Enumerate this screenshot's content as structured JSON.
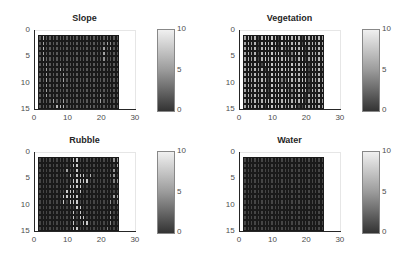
{
  "figure": {
    "panels": [
      {
        "title": "Slope",
        "left": 0,
        "top": 0
      },
      {
        "title": "Vegetation",
        "left": 205,
        "top": 0
      },
      {
        "title": "Rubble",
        "left": 0,
        "top": 122
      },
      {
        "title": "Water",
        "left": 205,
        "top": 122
      }
    ],
    "x_ticks": [
      "0",
      "10",
      "20",
      "30"
    ],
    "y_ticks": [
      "0",
      "5",
      "10",
      "15"
    ],
    "colorbar_ticks": [
      "10",
      "5",
      "0"
    ]
  },
  "chart_data": [
    {
      "type": "heatmap",
      "title": "Slope",
      "xlim": [
        0,
        30
      ],
      "ylim": [
        0,
        15
      ],
      "y_reversed": true,
      "x_ticks": [
        0,
        10,
        20,
        30
      ],
      "y_ticks": [
        0,
        5,
        10,
        15
      ],
      "extent_x": [
        1,
        25
      ],
      "extent_y": [
        1,
        15
      ],
      "clim": [
        0,
        10
      ],
      "colormap": "gray",
      "colorbar_ticks": [
        0,
        5,
        10
      ],
      "grid": [
        [
          2,
          7,
          2,
          2,
          2,
          2,
          2,
          2,
          2,
          2,
          2,
          2,
          2,
          2,
          2,
          2,
          2,
          2,
          2,
          2,
          3,
          2,
          2,
          2
        ],
        [
          2,
          6,
          2,
          2,
          2,
          2,
          2,
          2,
          2,
          2,
          2,
          2,
          2,
          2,
          2,
          2,
          2,
          2,
          2,
          3,
          6,
          5,
          2,
          2
        ],
        [
          2,
          7,
          2,
          2,
          2,
          2,
          2,
          2,
          2,
          2,
          2,
          2,
          2,
          2,
          2,
          2,
          2,
          2,
          2,
          6,
          3,
          6,
          2,
          2
        ],
        [
          2,
          6,
          2,
          2,
          2,
          2,
          2,
          2,
          2,
          2,
          2,
          2,
          2,
          2,
          2,
          2,
          2,
          2,
          2,
          6,
          2,
          2,
          2,
          2
        ],
        [
          2,
          6,
          3,
          2,
          2,
          2,
          2,
          2,
          2,
          2,
          2,
          2,
          2,
          2,
          2,
          2,
          2,
          2,
          2,
          5,
          2,
          2,
          2,
          2
        ],
        [
          2,
          3,
          5,
          2,
          2,
          2,
          3,
          2,
          2,
          2,
          2,
          2,
          2,
          2,
          2,
          2,
          2,
          2,
          2,
          3,
          2,
          2,
          2,
          2
        ],
        [
          1,
          2,
          6,
          2,
          2,
          2,
          6,
          3,
          2,
          2,
          2,
          2,
          2,
          2,
          2,
          2,
          2,
          2,
          2,
          2,
          2,
          2,
          2,
          2
        ],
        [
          2,
          2,
          6,
          2,
          2,
          2,
          2,
          6,
          2,
          2,
          2,
          2,
          2,
          2,
          2,
          2,
          2,
          2,
          2,
          2,
          2,
          2,
          2,
          2
        ],
        [
          2,
          2,
          6,
          2,
          2,
          2,
          2,
          6,
          2,
          2,
          2,
          2,
          2,
          2,
          2,
          2,
          2,
          2,
          2,
          2,
          2,
          2,
          2,
          2
        ],
        [
          2,
          2,
          5,
          2,
          2,
          2,
          2,
          5,
          2,
          2,
          2,
          2,
          2,
          2,
          2,
          2,
          2,
          2,
          2,
          2,
          2,
          2,
          2,
          2
        ],
        [
          2,
          2,
          6,
          2,
          2,
          2,
          2,
          2,
          2,
          2,
          2,
          2,
          2,
          2,
          2,
          2,
          2,
          2,
          2,
          2,
          2,
          2,
          2,
          2
        ],
        [
          2,
          2,
          6,
          2,
          2,
          2,
          2,
          2,
          2,
          2,
          2,
          2,
          2,
          2,
          2,
          2,
          2,
          2,
          5,
          2,
          2,
          2,
          2,
          2
        ],
        [
          2,
          2,
          2,
          2,
          6,
          2,
          2,
          6,
          2,
          2,
          2,
          2,
          2,
          2,
          2,
          2,
          2,
          2,
          6,
          2,
          2,
          2,
          2,
          2
        ],
        [
          2,
          2,
          2,
          2,
          2,
          7,
          7,
          7,
          2,
          2,
          2,
          2,
          2,
          2,
          2,
          3,
          2,
          2,
          2,
          2,
          2,
          2,
          2,
          2
        ]
      ]
    },
    {
      "type": "heatmap",
      "title": "Vegetation",
      "xlim": [
        0,
        30
      ],
      "ylim": [
        0,
        15
      ],
      "y_reversed": true,
      "x_ticks": [
        0,
        10,
        20,
        30
      ],
      "y_ticks": [
        0,
        5,
        10,
        15
      ],
      "extent_x": [
        1,
        25
      ],
      "extent_y": [
        1,
        15
      ],
      "clim": [
        0,
        10
      ],
      "colormap": "gray",
      "colorbar_ticks": [
        0,
        5,
        10
      ],
      "grid": [
        [
          6,
          7,
          6,
          7,
          1,
          7,
          8,
          7,
          8,
          7,
          1,
          8,
          7,
          8,
          7,
          8,
          7,
          1,
          7,
          6,
          7,
          6,
          7,
          6
        ],
        [
          6,
          7,
          6,
          7,
          1,
          7,
          8,
          7,
          8,
          7,
          1,
          8,
          7,
          8,
          7,
          8,
          7,
          1,
          7,
          6,
          7,
          6,
          7,
          6
        ],
        [
          6,
          7,
          6,
          7,
          1,
          7,
          8,
          7,
          8,
          7,
          1,
          7,
          4,
          4,
          7,
          8,
          7,
          8,
          1,
          6,
          7,
          6,
          7,
          6
        ],
        [
          6,
          7,
          6,
          7,
          1,
          7,
          8,
          7,
          8,
          7,
          8,
          7,
          4,
          4,
          4,
          8,
          7,
          8,
          1,
          6,
          7,
          6,
          7,
          6
        ],
        [
          6,
          7,
          6,
          7,
          1,
          7,
          8,
          7,
          8,
          7,
          8,
          7,
          8,
          7,
          4,
          4,
          7,
          8,
          1,
          6,
          7,
          6,
          7,
          6
        ],
        [
          6,
          7,
          6,
          7,
          6,
          1,
          8,
          7,
          8,
          7,
          8,
          7,
          8,
          7,
          8,
          7,
          7,
          8,
          7,
          1,
          7,
          6,
          7,
          6
        ],
        [
          6,
          7,
          6,
          7,
          6,
          7,
          1,
          7,
          8,
          7,
          8,
          7,
          8,
          7,
          8,
          7,
          7,
          8,
          7,
          1,
          7,
          6,
          7,
          3
        ],
        [
          6,
          7,
          6,
          7,
          6,
          7,
          7,
          1,
          8,
          7,
          8,
          7,
          8,
          7,
          8,
          7,
          7,
          8,
          7,
          1,
          7,
          6,
          7,
          3
        ],
        [
          6,
          7,
          6,
          7,
          6,
          7,
          7,
          1,
          8,
          7,
          8,
          4,
          4,
          8,
          7,
          7,
          7,
          8,
          7,
          1,
          7,
          6,
          7,
          6
        ],
        [
          6,
          7,
          6,
          7,
          6,
          7,
          7,
          1,
          8,
          7,
          8,
          4,
          8,
          4,
          7,
          7,
          7,
          8,
          7,
          1,
          7,
          6,
          7,
          6
        ],
        [
          6,
          7,
          6,
          7,
          6,
          7,
          7,
          1,
          8,
          7,
          8,
          7,
          8,
          4,
          4,
          7,
          7,
          8,
          7,
          1,
          7,
          6,
          7,
          6
        ],
        [
          6,
          7,
          6,
          7,
          6,
          7,
          7,
          1,
          8,
          7,
          8,
          7,
          8,
          7,
          4,
          7,
          7,
          8,
          1,
          6,
          7,
          6,
          7,
          6
        ],
        [
          6,
          7,
          6,
          7,
          6,
          7,
          7,
          8,
          8,
          7,
          8,
          7,
          8,
          7,
          7,
          7,
          7,
          8,
          1,
          6,
          7,
          6,
          7,
          6
        ],
        [
          6,
          7,
          6,
          7,
          6,
          7,
          1,
          8,
          8,
          7,
          8,
          7,
          5,
          7,
          7,
          7,
          1,
          1,
          6,
          6,
          7,
          6,
          7,
          6
        ]
      ]
    },
    {
      "type": "heatmap",
      "title": "Rubble",
      "xlim": [
        0,
        30
      ],
      "ylim": [
        0,
        15
      ],
      "y_reversed": true,
      "x_ticks": [
        0,
        10,
        20,
        30
      ],
      "y_ticks": [
        0,
        5,
        10,
        15
      ],
      "extent_x": [
        1,
        25
      ],
      "extent_y": [
        1,
        15
      ],
      "clim": [
        0,
        10
      ],
      "colormap": "gray",
      "colorbar_ticks": [
        0,
        5,
        10
      ],
      "grid": [
        [
          1,
          1,
          1,
          1,
          1,
          1,
          1,
          1,
          1,
          1,
          8,
          8,
          1,
          1,
          1,
          1,
          1,
          1,
          1,
          1,
          1,
          1,
          5,
          5
        ],
        [
          1,
          1,
          1,
          1,
          1,
          1,
          1,
          1,
          1,
          1,
          8,
          8,
          1,
          1,
          1,
          1,
          1,
          1,
          1,
          1,
          1,
          1,
          1,
          6
        ],
        [
          1,
          1,
          1,
          1,
          1,
          1,
          1,
          1,
          6,
          1,
          1,
          8,
          1,
          1,
          1,
          1,
          1,
          1,
          1,
          1,
          1,
          1,
          5,
          1
        ],
        [
          1,
          1,
          1,
          1,
          1,
          1,
          1,
          1,
          1,
          7,
          1,
          8,
          8,
          8,
          1,
          7,
          1,
          1,
          1,
          1,
          1,
          4,
          5,
          1
        ],
        [
          1,
          1,
          1,
          1,
          1,
          1,
          1,
          1,
          1,
          1,
          8,
          8,
          8,
          8,
          8,
          1,
          1,
          1,
          1,
          1,
          1,
          1,
          4,
          5
        ],
        [
          1,
          1,
          1,
          1,
          1,
          1,
          1,
          1,
          1,
          8,
          8,
          8,
          8,
          1,
          1,
          1,
          1,
          1,
          1,
          1,
          1,
          1,
          1,
          1
        ],
        [
          1,
          1,
          1,
          1,
          1,
          1,
          1,
          1,
          8,
          8,
          8,
          1,
          8,
          1,
          1,
          1,
          1,
          1,
          1,
          1,
          1,
          1,
          1,
          1
        ],
        [
          1,
          1,
          1,
          1,
          1,
          1,
          1,
          8,
          8,
          8,
          8,
          8,
          1,
          1,
          1,
          1,
          1,
          1,
          1,
          1,
          1,
          1,
          6,
          6
        ],
        [
          1,
          1,
          1,
          1,
          1,
          1,
          1,
          8,
          1,
          8,
          8,
          8,
          1,
          1,
          1,
          1,
          1,
          1,
          1,
          1,
          1,
          5,
          1,
          5
        ],
        [
          1,
          1,
          1,
          1,
          1,
          1,
          1,
          1,
          1,
          1,
          1,
          8,
          8,
          1,
          1,
          1,
          1,
          1,
          1,
          1,
          1,
          1,
          1,
          1
        ],
        [
          1,
          1,
          1,
          1,
          1,
          1,
          1,
          1,
          1,
          1,
          8,
          1,
          8,
          1,
          1,
          1,
          1,
          1,
          1,
          1,
          1,
          5,
          1,
          1
        ],
        [
          1,
          1,
          1,
          1,
          1,
          1,
          1,
          1,
          1,
          1,
          8,
          1,
          8,
          8,
          1,
          1,
          1,
          1,
          1,
          1,
          1,
          5,
          1,
          1
        ],
        [
          1,
          1,
          1,
          1,
          1,
          1,
          1,
          1,
          1,
          1,
          8,
          1,
          1,
          8,
          8,
          1,
          1,
          1,
          1,
          1,
          1,
          5,
          1,
          1
        ],
        [
          1,
          1,
          1,
          1,
          1,
          1,
          1,
          1,
          1,
          1,
          8,
          8,
          1,
          1,
          1,
          1,
          1,
          1,
          1,
          1,
          4,
          1,
          1,
          1
        ]
      ]
    },
    {
      "type": "heatmap",
      "title": "Water",
      "xlim": [
        0,
        30
      ],
      "ylim": [
        0,
        15
      ],
      "y_reversed": true,
      "x_ticks": [
        0,
        10,
        20,
        30
      ],
      "y_ticks": [
        0,
        5,
        10,
        15
      ],
      "extent_x": [
        1,
        25
      ],
      "extent_y": [
        1,
        15
      ],
      "clim": [
        0,
        10
      ],
      "colormap": "gray",
      "colorbar_ticks": [
        0,
        5,
        10
      ],
      "grid_fill_value": 1,
      "rows": 14,
      "cols": 24
    }
  ]
}
